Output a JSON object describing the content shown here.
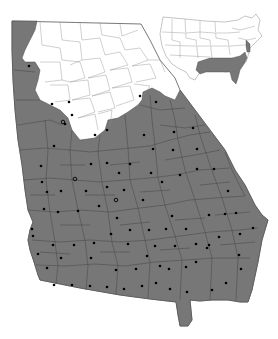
{
  "map": {
    "title": "",
    "region": "Georgia",
    "inset": "Contiguous United States",
    "legend": [],
    "colors": {
      "range_fill": "#777777",
      "outside_fill": "#ffffff",
      "county_border": "#3f3f3f",
      "marker": "#000000"
    },
    "markers": {
      "solid_dot_count_approx": 90,
      "open_circle_count_approx": 3
    }
  }
}
